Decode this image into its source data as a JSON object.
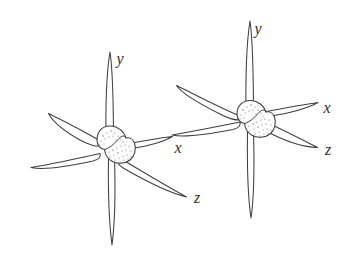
{
  "figure": {
    "background_color": "#ffffff",
    "line_color": "#3f3f3f",
    "stipple_color": "#6b6b6b",
    "label_color": "#2f2f2f",
    "style": "hand-drawn line illustration"
  },
  "systems": [
    {
      "name": "left-coordinate-system",
      "origin": {
        "x": 110,
        "y": 148
      },
      "hub": {
        "name": "origin-sphere",
        "radius": 15,
        "shading": "stippled"
      },
      "axes": [
        {
          "id": "y",
          "label": "y",
          "label_position": {
            "x": 120,
            "y": 64
          },
          "tip_positive": {
            "x": 110,
            "y": 52
          },
          "tip_negative": {
            "x": 112,
            "y": 245
          },
          "direction": "vertical"
        },
        {
          "id": "x",
          "label": "x",
          "label_position": {
            "x": 176,
            "y": 152
          },
          "tip_positive": {
            "x": 172,
            "y": 136
          },
          "tip_negative": {
            "x": 31,
            "y": 168
          },
          "direction": "right-slightly-up"
        },
        {
          "id": "z",
          "label": "z",
          "label_position": {
            "x": 196,
            "y": 202
          },
          "tip_positive": {
            "x": 186,
            "y": 196
          },
          "tip_negative": {
            "x": 48,
            "y": 113
          },
          "direction": "down-right-diagonal"
        }
      ]
    },
    {
      "name": "right-coordinate-system",
      "origin": {
        "x": 250,
        "y": 122
      },
      "hub": {
        "name": "origin-sphere",
        "radius": 15,
        "shading": "stippled"
      },
      "axes": [
        {
          "id": "y",
          "label": "y",
          "label_position": {
            "x": 258,
            "y": 34
          },
          "tip_positive": {
            "x": 250,
            "y": 21
          },
          "tip_negative": {
            "x": 251,
            "y": 218
          },
          "direction": "vertical"
        },
        {
          "id": "x",
          "label": "x",
          "label_position": {
            "x": 325,
            "y": 112
          },
          "tip_positive": {
            "x": 318,
            "y": 102
          },
          "tip_negative": {
            "x": 172,
            "y": 135
          },
          "direction": "right-slightly-up"
        },
        {
          "id": "z",
          "label": "z",
          "label_position": {
            "x": 326,
            "y": 154
          },
          "tip_positive": {
            "x": 317,
            "y": 147
          },
          "tip_negative": {
            "x": 176,
            "y": 85
          },
          "direction": "down-right-diagonal"
        }
      ]
    }
  ],
  "labels": {
    "left_y": "y",
    "left_x": "x",
    "left_z": "z",
    "right_y": "y",
    "right_x": "x",
    "right_z": "z"
  }
}
